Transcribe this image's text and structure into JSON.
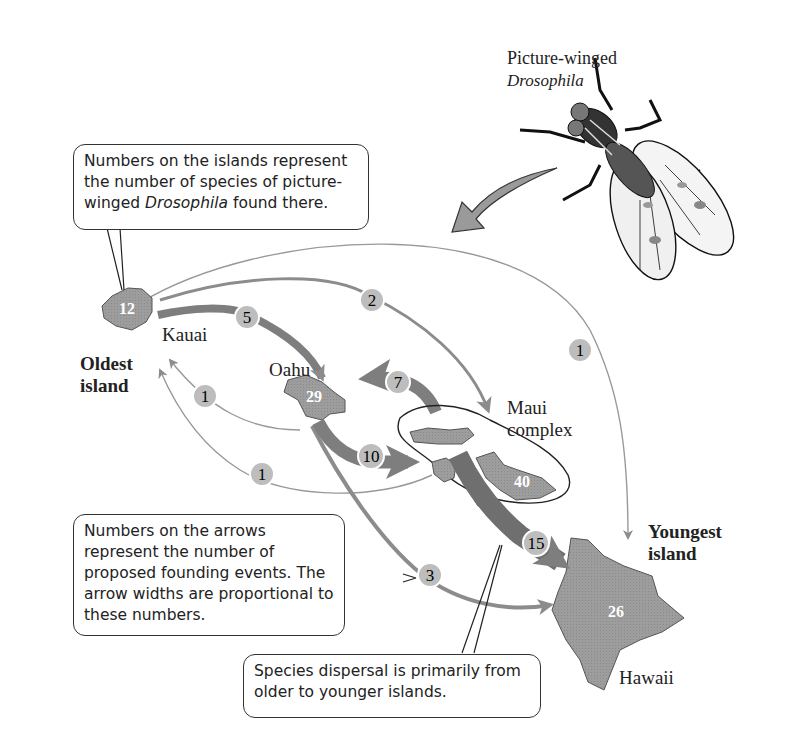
{
  "title": {
    "line1": "Picture-winged",
    "line2": "Drosophila"
  },
  "notes": {
    "islands_note": {
      "part1": "Numbers on the islands represent the number of species of picture-winged ",
      "italic": "Drosophila",
      "part2": " found there."
    },
    "arrows_note": "Numbers on the arrows represent the number of proposed founding events.  The arrow widths are proportional to these numbers.",
    "dispersal_note": "Species dispersal is primarily from older to younger islands."
  },
  "labels": {
    "oldest": [
      "Oldest",
      "island"
    ],
    "youngest": [
      "Youngest",
      "island"
    ]
  },
  "islands": [
    {
      "name": "Kauai",
      "species": "12"
    },
    {
      "name": "Oahu",
      "species": "29"
    },
    {
      "name": "Maui complex",
      "name_lines": [
        "Maui",
        "complex"
      ],
      "species": "40"
    },
    {
      "name": "Hawaii",
      "species": "26"
    }
  ],
  "arrows": [
    {
      "from": "Kauai",
      "to": "Oahu",
      "events": "5"
    },
    {
      "from": "Kauai",
      "to": "Maui complex",
      "events": "2"
    },
    {
      "from": "Kauai",
      "to": "Hawaii",
      "events": "1"
    },
    {
      "from": "Oahu",
      "to": "Kauai",
      "events": "1"
    },
    {
      "from": "Maui complex",
      "to": "Kauai",
      "events": "1"
    },
    {
      "from": "Maui complex",
      "to": "Oahu",
      "events": "7"
    },
    {
      "from": "Oahu",
      "to": "Maui complex",
      "events": "10"
    },
    {
      "from": "Oahu",
      "to": "Hawaii",
      "events": "3"
    },
    {
      "from": "Maui complex",
      "to": "Hawaii",
      "events": "15"
    }
  ],
  "colors": {
    "island_fill": "#9a9a9a",
    "arrow": "#8c8c8c",
    "badge": "#bdbdbd",
    "outline": "#333333"
  }
}
